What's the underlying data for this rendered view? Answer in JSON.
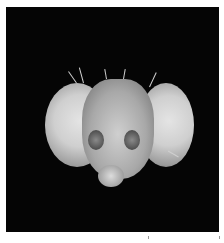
{
  "image": {
    "subject": "fly-head-micrograph",
    "background_color": "#050505",
    "border_color": "#ffffff"
  }
}
